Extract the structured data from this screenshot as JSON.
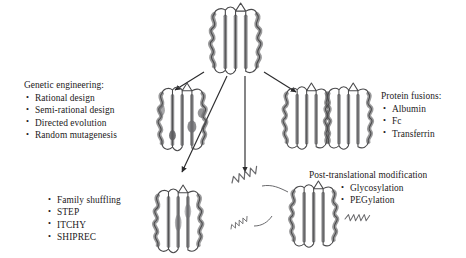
{
  "figure": {
    "kind": "protein-engineering-strategies-diagram",
    "background_color": "#ffffff",
    "text_color": "#1d1a1b",
    "bullet_glyph": "•",
    "center_label": "",
    "ribbon": {
      "outline_color": "#5f5f60",
      "helix_fill": "#9a9a9c",
      "strand_fill": "#8c8c8e",
      "mutation_patch_color": "#6f6f72",
      "arrow_color": "#2b2b2d",
      "squiggle_color": "#6a6a6d"
    }
  },
  "blocks": {
    "genetic_engineering": {
      "heading": "Genetic engineering:",
      "items": [
        "Rational design",
        "Semi-rational design",
        "Directed evolution",
        "Random mutagenesis"
      ]
    },
    "protein_fusions": {
      "heading": "Protein fusions:",
      "items": [
        "Albumin",
        "Fc",
        "Transferrin"
      ]
    },
    "recombination": {
      "heading": "",
      "items": [
        "Family shuffling",
        "STEP",
        "ITCHY",
        "SHIPREC"
      ]
    },
    "post_translational": {
      "heading": "Post-translational modification",
      "items": [
        "Glycosylation",
        "PEGylation"
      ]
    }
  },
  "structures": {
    "parent": {
      "name": "parent-protein-structure"
    },
    "mutated": {
      "name": "mutated-protein-structure"
    },
    "fusion": {
      "name": "fusion-protein-structure"
    },
    "recombined": {
      "name": "recombined-protein-structure"
    },
    "modified": {
      "name": "glycosylated-pegylated-protein-structure"
    }
  },
  "arrows": [
    {
      "name": "arrow-to-genetic-engineering",
      "direction": "down-left"
    },
    {
      "name": "arrow-to-recombination",
      "direction": "down-left-steep"
    },
    {
      "name": "arrow-to-post-translational",
      "direction": "down"
    },
    {
      "name": "arrow-to-protein-fusions",
      "direction": "down-right"
    }
  ]
}
